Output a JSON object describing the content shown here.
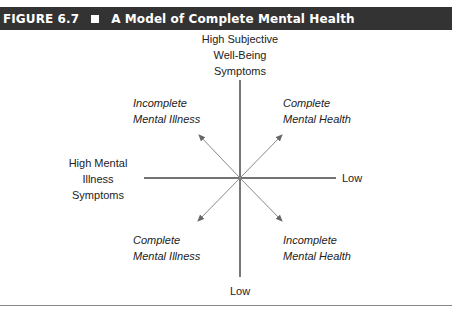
{
  "header": {
    "figure_number": "FIGURE 6.7",
    "title": "A Model of Complete Mental Health",
    "background": "#333333",
    "text_color": "#ffffff"
  },
  "axes": {
    "top_label": [
      "High Subjective",
      "Well-Being",
      "Symptoms"
    ],
    "bottom_label": "Low",
    "left_label": [
      "High Mental",
      "Illness",
      "Symptoms"
    ],
    "right_label": "Low"
  },
  "quadrants": {
    "upper_left": [
      "Incomplete",
      "Mental Illness"
    ],
    "upper_right": [
      "Complete",
      "Mental Health"
    ],
    "lower_left": [
      "Complete",
      "Mental Illness"
    ],
    "lower_right": [
      "Incomplete",
      "Mental Health"
    ]
  },
  "colors": {
    "axis_line": "#555555",
    "arrow_line": "#888888"
  }
}
